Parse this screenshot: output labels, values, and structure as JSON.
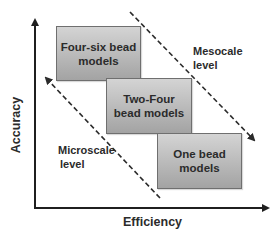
{
  "diagram": {
    "type": "scale-accuracy-efficiency",
    "axes": {
      "x_label": "Efficiency",
      "y_label": "Accuracy"
    },
    "boxes": [
      {
        "id": "four-six",
        "line1": "Four-six bead",
        "line2": "models"
      },
      {
        "id": "two-four",
        "line1": "Two-Four",
        "line2": "bead models"
      },
      {
        "id": "one",
        "line1": "One bead",
        "line2": "models"
      }
    ],
    "annotations": {
      "mesoscale": {
        "line1": "Mesocale",
        "line2": "level"
      },
      "microscale": {
        "line1": "Microscale",
        "line2": "level"
      }
    },
    "colors": {
      "axis": "#1f1f1f",
      "box_top": "#d4d4d4",
      "box_bottom": "#a3a3a3",
      "box_border": "#6f6f6f",
      "text": "#2b2b2b"
    }
  }
}
